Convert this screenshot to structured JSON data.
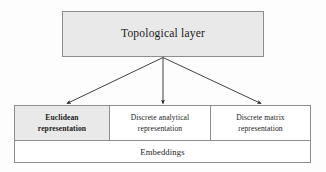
{
  "diagram": {
    "type": "block-hierarchy",
    "background_color": "#fdfdfd",
    "border_color": "#8d8d8d",
    "shaded_color": "#e9e9e9",
    "plain_color": "#ffffff",
    "text_color": "#1b1b1b",
    "top_node": {
      "label": "Topological layer",
      "shaded": true
    },
    "arrows": {
      "count": 3,
      "origin": "bottom-center of Topological layer",
      "style": "solid line with filled arrowhead",
      "color": "#2b2b2b",
      "targets": [
        "Euclidean representation",
        "Discrete analytical representation",
        "Discrete matrix representation"
      ]
    },
    "representation_row": [
      {
        "line1": "Euclidean",
        "line2": "representation",
        "shaded": true
      },
      {
        "line1": "Discrete analytical",
        "line2": "representation",
        "shaded": false
      },
      {
        "line1": "Discrete matrix",
        "line2": "representation",
        "shaded": false
      }
    ],
    "embeddings_row": {
      "label": "Embeddings",
      "shaded": false
    }
  }
}
